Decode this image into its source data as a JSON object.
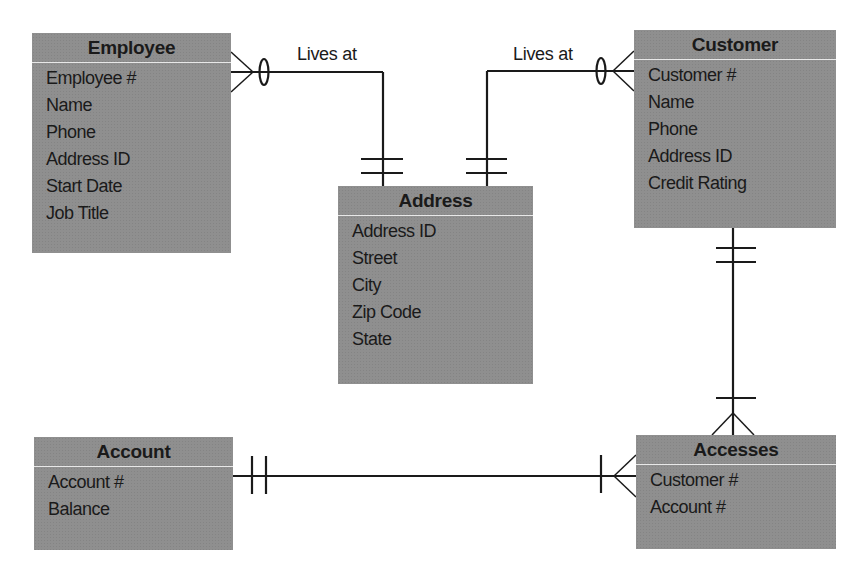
{
  "diagram": {
    "type": "entity-relationship",
    "entities": [
      {
        "id": "employee",
        "name": "Employee",
        "attributes": [
          "Employee #",
          "Name",
          "Phone",
          "Address ID",
          "Start Date",
          "Job Title"
        ]
      },
      {
        "id": "customer",
        "name": "Customer",
        "attributes": [
          "Customer #",
          "Name",
          "Phone",
          "Address ID",
          "Credit Rating"
        ]
      },
      {
        "id": "address",
        "name": "Address",
        "attributes": [
          "Address ID",
          "Street",
          "City",
          "Zip Code",
          "State"
        ]
      },
      {
        "id": "account",
        "name": "Account",
        "attributes": [
          "Account #",
          "Balance"
        ]
      },
      {
        "id": "accesses",
        "name": "Accesses",
        "attributes": [
          "Customer #",
          "Account #"
        ]
      }
    ],
    "relationships": [
      {
        "from": "employee",
        "to": "address",
        "label": "Lives at",
        "from_cardinality": "zero-or-many",
        "to_cardinality": "one-and-only-one"
      },
      {
        "from": "customer",
        "to": "address",
        "label": "Lives at",
        "from_cardinality": "zero-or-many",
        "to_cardinality": "one-and-only-one"
      },
      {
        "from": "customer",
        "to": "accesses",
        "label": "",
        "from_cardinality": "one-and-only-one",
        "to_cardinality": "one-or-many"
      },
      {
        "from": "account",
        "to": "accesses",
        "label": "",
        "from_cardinality": "one-and-only-one",
        "to_cardinality": "one-or-many"
      }
    ],
    "colors": {
      "entity_fill": "#8f8f8f",
      "divider": "#e8e8e8",
      "line": "#1a1a1a",
      "background": "#ffffff"
    }
  }
}
